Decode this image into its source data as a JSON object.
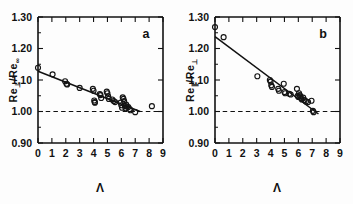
{
  "figure": {
    "background": "#ffffff",
    "ink_color": "#121212",
    "panel_count": 2
  },
  "chart_data": [
    {
      "type": "scatter",
      "panel_label": "a",
      "title": "",
      "xlabel": "Λ",
      "ylabel": "Re⊥/Re∞",
      "ylabel_base": "Re",
      "ylabel_sub1": "⊥",
      "ylabel_mid": "/Re",
      "ylabel_sub2": "∞",
      "xlim": [
        0,
        9
      ],
      "ylim": [
        0.9,
        1.3
      ],
      "xticks": [
        0,
        1,
        2,
        3,
        4,
        5,
        6,
        7,
        8,
        9
      ],
      "xticklabels": [
        "0",
        "1",
        "2",
        "3",
        "4",
        "5",
        "6",
        "7",
        "8",
        "9"
      ],
      "yticks": [
        0.9,
        1.0,
        1.1,
        1.2,
        1.3
      ],
      "yticklabels": [
        "0.90",
        "1.00",
        "1.10",
        "1.20",
        "1.30"
      ],
      "grid": false,
      "legend": "none",
      "marker": "open-circle",
      "reference_line": {
        "y": 1.0,
        "style": "dashed",
        "label": "unity reference"
      },
      "fit_line": {
        "x": [
          0.0,
          7.35
        ],
        "y": [
          1.128,
          1.0
        ],
        "style": "solid"
      },
      "points": [
        {
          "x": 0.0,
          "y": 1.139
        },
        {
          "x": 1.05,
          "y": 1.118
        },
        {
          "x": 1.95,
          "y": 1.096
        },
        {
          "x": 2.05,
          "y": 1.088
        },
        {
          "x": 2.1,
          "y": 1.086
        },
        {
          "x": 3.0,
          "y": 1.075
        },
        {
          "x": 3.95,
          "y": 1.072
        },
        {
          "x": 4.0,
          "y": 1.066
        },
        {
          "x": 4.05,
          "y": 1.035
        },
        {
          "x": 4.08,
          "y": 1.03
        },
        {
          "x": 4.1,
          "y": 1.028
        },
        {
          "x": 4.45,
          "y": 1.055
        },
        {
          "x": 4.5,
          "y": 1.052
        },
        {
          "x": 4.55,
          "y": 1.043
        },
        {
          "x": 4.95,
          "y": 1.063
        },
        {
          "x": 5.0,
          "y": 1.058
        },
        {
          "x": 5.05,
          "y": 1.048
        },
        {
          "x": 5.1,
          "y": 1.04
        },
        {
          "x": 5.35,
          "y": 1.038
        },
        {
          "x": 5.45,
          "y": 1.033
        },
        {
          "x": 5.55,
          "y": 1.03
        },
        {
          "x": 5.95,
          "y": 1.028
        },
        {
          "x": 6.0,
          "y": 1.02
        },
        {
          "x": 6.05,
          "y": 1.012
        },
        {
          "x": 6.1,
          "y": 1.045
        },
        {
          "x": 6.15,
          "y": 1.04
        },
        {
          "x": 6.2,
          "y": 1.033
        },
        {
          "x": 6.25,
          "y": 1.018
        },
        {
          "x": 6.3,
          "y": 1.01
        },
        {
          "x": 6.35,
          "y": 1.022
        },
        {
          "x": 6.4,
          "y": 1.016
        },
        {
          "x": 6.5,
          "y": 1.014
        },
        {
          "x": 6.6,
          "y": 1.008
        },
        {
          "x": 6.65,
          "y": 1.004
        },
        {
          "x": 7.0,
          "y": 0.998
        },
        {
          "x": 8.2,
          "y": 1.017
        }
      ]
    },
    {
      "type": "scatter",
      "panel_label": "b",
      "title": "",
      "xlabel": "Λ",
      "ylabel": "Re∥/Re⊥",
      "ylabel_base": "Re",
      "ylabel_sub1": "∥",
      "ylabel_mid": "/Re",
      "ylabel_sub2": "⊥",
      "xlim": [
        0,
        9
      ],
      "ylim": [
        0.9,
        1.3
      ],
      "xticks": [
        0,
        1,
        2,
        3,
        4,
        5,
        6,
        7,
        8,
        9
      ],
      "xticklabels": [
        "0",
        "1",
        "2",
        "3",
        "4",
        "5",
        "6",
        "7",
        "8",
        "9"
      ],
      "yticks": [
        0.9,
        1.0,
        1.1,
        1.2,
        1.3
      ],
      "yticklabels": [
        "0.90",
        "1.00",
        "1.10",
        "1.20",
        "1.30"
      ],
      "grid": false,
      "legend": "none",
      "marker": "open-circle",
      "reference_line": {
        "y": 1.0,
        "style": "dashed",
        "label": "unity reference"
      },
      "fit_line": {
        "x": [
          0.0,
          7.45
        ],
        "y": [
          1.238,
          0.992
        ],
        "style": "solid"
      },
      "points": [
        {
          "x": 0.0,
          "y": 1.268
        },
        {
          "x": 0.62,
          "y": 1.236
        },
        {
          "x": 3.05,
          "y": 1.112
        },
        {
          "x": 3.95,
          "y": 1.1
        },
        {
          "x": 4.0,
          "y": 1.095
        },
        {
          "x": 4.05,
          "y": 1.083
        },
        {
          "x": 4.1,
          "y": 1.078
        },
        {
          "x": 4.55,
          "y": 1.072
        },
        {
          "x": 4.6,
          "y": 1.066
        },
        {
          "x": 4.95,
          "y": 1.088
        },
        {
          "x": 5.0,
          "y": 1.062
        },
        {
          "x": 5.05,
          "y": 1.058
        },
        {
          "x": 5.35,
          "y": 1.056
        },
        {
          "x": 5.45,
          "y": 1.054
        },
        {
          "x": 5.9,
          "y": 1.072
        },
        {
          "x": 5.95,
          "y": 1.05
        },
        {
          "x": 6.0,
          "y": 1.046
        },
        {
          "x": 6.05,
          "y": 1.058
        },
        {
          "x": 6.1,
          "y": 1.052
        },
        {
          "x": 6.15,
          "y": 1.048
        },
        {
          "x": 6.2,
          "y": 1.042
        },
        {
          "x": 6.25,
          "y": 1.038
        },
        {
          "x": 6.35,
          "y": 1.044
        },
        {
          "x": 6.45,
          "y": 1.036
        },
        {
          "x": 6.55,
          "y": 1.032
        },
        {
          "x": 6.7,
          "y": 1.03
        },
        {
          "x": 6.95,
          "y": 1.034
        },
        {
          "x": 7.05,
          "y": 1.002
        },
        {
          "x": 7.1,
          "y": 0.998
        }
      ]
    }
  ]
}
